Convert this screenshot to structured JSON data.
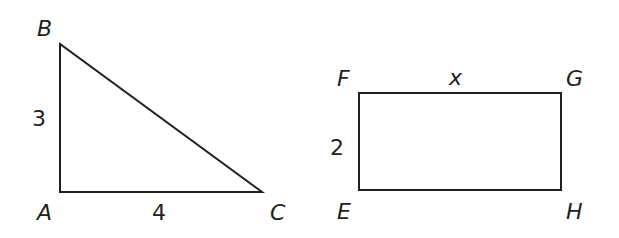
{
  "triangle": {
    "vertices": {
      "A": "A",
      "B": "B",
      "C": "C"
    },
    "side_AB": "3",
    "side_AC": "4"
  },
  "rectangle": {
    "vertices": {
      "E": "E",
      "F": "F",
      "G": "G",
      "H": "H"
    },
    "side_FE": "2",
    "side_FG": "x"
  },
  "colors": {
    "stroke": "#231f20",
    "background": "#ffffff"
  }
}
